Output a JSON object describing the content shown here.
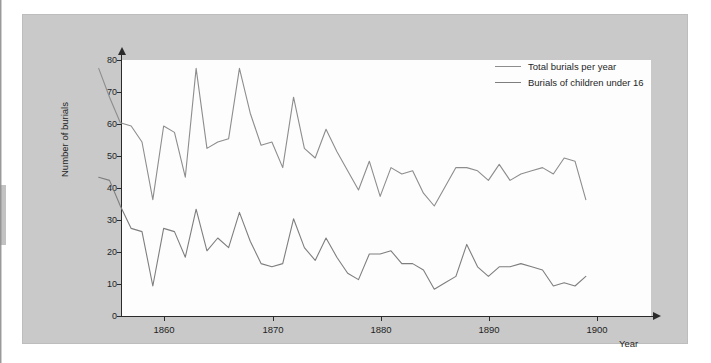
{
  "figure": {
    "y_axis_title": "Number of burials",
    "x_axis_title": "Year"
  },
  "legend": {
    "position": "top-right",
    "entries": [
      {
        "label": "Total burials per year",
        "color": "#8d8d8d"
      },
      {
        "label": "Burials of children under 16",
        "color": "#7e7e7e"
      }
    ]
  },
  "axes": {
    "y_ticks": [
      "0",
      "10",
      "20",
      "30",
      "40",
      "50",
      "60",
      "70",
      "80"
    ],
    "x_ticks": [
      "1860",
      "1870",
      "1880",
      "1890",
      "1900"
    ]
  },
  "chart_data": {
    "type": "line",
    "title": "",
    "subtitle": "",
    "xlabel": "Year",
    "ylabel": "Number of burials",
    "xlim": [
      1856,
      1901
    ],
    "ylim": [
      0,
      80
    ],
    "grid": false,
    "legend_position": "top-right",
    "x": [
      1856,
      1857,
      1858,
      1859,
      1860,
      1861,
      1862,
      1863,
      1864,
      1865,
      1866,
      1867,
      1868,
      1869,
      1870,
      1871,
      1872,
      1873,
      1874,
      1875,
      1876,
      1877,
      1878,
      1879,
      1880,
      1881,
      1882,
      1883,
      1884,
      1885,
      1886,
      1887,
      1888,
      1889,
      1890,
      1891,
      1892,
      1893,
      1894,
      1895,
      1896,
      1897,
      1898,
      1899,
      1900,
      1901
    ],
    "series": [
      {
        "name": "Total burials per year",
        "color": "#8d8d8d",
        "values": [
          73,
          64,
          56,
          55,
          50,
          32,
          55,
          53,
          39,
          73,
          48,
          50,
          51,
          73,
          59,
          49,
          50,
          42,
          64,
          48,
          45,
          54,
          47,
          41,
          35,
          44,
          33,
          42,
          40,
          41,
          34,
          30,
          36,
          42,
          42,
          41,
          38,
          43,
          38,
          40,
          41,
          42,
          40,
          45,
          44,
          32
        ]
      },
      {
        "name": "Burials of children under 16",
        "color": "#7e7e7e",
        "values": [
          39,
          38,
          30,
          23,
          22,
          5,
          23,
          22,
          14,
          29,
          16,
          20,
          17,
          28,
          19,
          12,
          11,
          12,
          26,
          17,
          13,
          20,
          14,
          9,
          7,
          15,
          15,
          16,
          12,
          12,
          10,
          4,
          6,
          8,
          18,
          11,
          8,
          11,
          11,
          12,
          11,
          10,
          5,
          6,
          5,
          8
        ]
      }
    ]
  }
}
